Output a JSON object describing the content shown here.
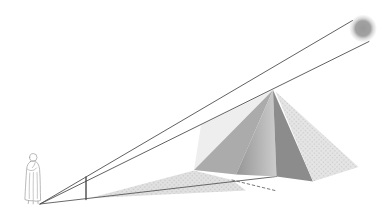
{
  "figure": {
    "name": "thales-pyramid-shadow-diagram",
    "background": "#ffffff",
    "width": 391,
    "height": 223
  },
  "sun": {
    "cx": 363,
    "cy": 28.5,
    "r": 14,
    "core_color": "#989898",
    "mid_color": "#a2a2a2",
    "edge_color": "#c8c8c8"
  },
  "rays": {
    "stroke": "#4f4f4f",
    "width": 0.9,
    "upper_points": "40,204 352.5,20.5",
    "lower_points": "40,204 369,41.5"
  },
  "ground_sightline": {
    "stroke": "#585858",
    "width": 0.9,
    "points": "40,204 276.5,176.5"
  },
  "gnomon": {
    "stroke": "#4a4a4a",
    "width": 1.4,
    "points": "86,199.5 86,177"
  },
  "cast_shadow": {
    "points": "89,198.3 194,170.5 232,180 246,190.5",
    "halftone_bg": "#e1e1e1",
    "halftone_dot": "#c6c6c6"
  },
  "hidden_shadow_edge": {
    "stroke": "#6a6a6a",
    "width": 0.9,
    "dash": "2.6,2.6",
    "points": "232,180 275,190.5"
  },
  "pyramid": {
    "sunlit_wash": {
      "points": "273,90 201,125 194,170",
      "fill": "#ebebeb"
    },
    "face_sw_left": {
      "points": "273,90 194,170 236,174.5",
      "fill": "#ababab"
    },
    "face_sw_right": {
      "points": "273,90 236,174.5 276.5,176.5",
      "grad_from": "#959595",
      "grad_to": "#cccccc"
    },
    "face_se": {
      "points": "273,90 276.5,176.5 313,181.5",
      "fill": "#8c8c8c"
    },
    "face_ne_lit": {
      "points": "275.5,91.5 313,181.5 358.5,167",
      "halftone_bg": "#e5e5e5",
      "halftone_dot": "#cbcbcb"
    }
  },
  "person": {
    "stroke": "#9b9b9b",
    "fill": "#f3f3f3",
    "head_d": "M29.6,157.3 a3.7,3.8 0 1 1 7.4,0.2 a3.7,3.8 0 1 1 -7.4,-0.2 Z",
    "body_d": "M30.5,161.5 C28.3,162.8 26.9,165.5 26.6,169.5 C26.2,175.5 25.3,189.5 24.9,199.5 C27.5,200.6 30.6,201 33.1,200.6 C35.3,201.5 38.6,201.3 40.6,200.4 C40.2,190.5 40.4,178.5 39.6,169.5 C39.1,164.8 37.2,162.2 35.4,161.4 C33.9,160.8 32,160.9 30.5,161.5 Z",
    "arm_d": "M27.4,169.2 C30.2,171.4 34.2,171 36.4,168 M35.2,162.6 C34.6,164.5 33.8,166.2 32.4,167.6",
    "folds_d": "M29.8,173 C29.3,181 29.1,191 29.3,198.5 M33.4,172.5 C33.2,182 33.1,192 33.3,199.5 M37,172.5 C37.3,181.5 37.5,191.5 37.3,198.5",
    "feet_d": "M28.6,200.8 L28.2,203.6 M33.2,201.2 L33.2,203.9 M37.9,201 L38.1,203.7"
  }
}
